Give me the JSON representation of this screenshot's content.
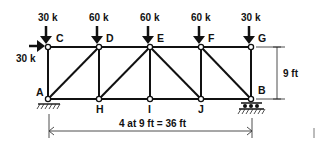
{
  "diagram": {
    "type": "truss",
    "nodes": {
      "top": [
        "C",
        "D",
        "E",
        "F",
        "G"
      ],
      "bottom": [
        "A",
        "H",
        "I",
        "J",
        "B"
      ]
    },
    "loads": [
      {
        "node": "C",
        "label": "30 k",
        "direction": "down"
      },
      {
        "node": "D",
        "label": "60 k",
        "direction": "down"
      },
      {
        "node": "E",
        "label": "60 k",
        "direction": "down"
      },
      {
        "node": "F",
        "label": "60 k",
        "direction": "down"
      },
      {
        "node": "G",
        "label": "30 k",
        "direction": "down"
      },
      {
        "node": "C",
        "label": "30 k",
        "direction": "right"
      }
    ],
    "labels": {
      "C": "C",
      "D": "D",
      "E": "E",
      "F": "F",
      "G": "G",
      "A": "A",
      "H": "H",
      "I": "I",
      "J": "J",
      "B": "B"
    },
    "supports": {
      "A": "pin",
      "B": "roller"
    },
    "dimensions": {
      "height": "9 ft",
      "span": "4 at 9 ft = 36 ft"
    },
    "colors": {
      "line": "#111111",
      "background": "#ffffff"
    }
  }
}
